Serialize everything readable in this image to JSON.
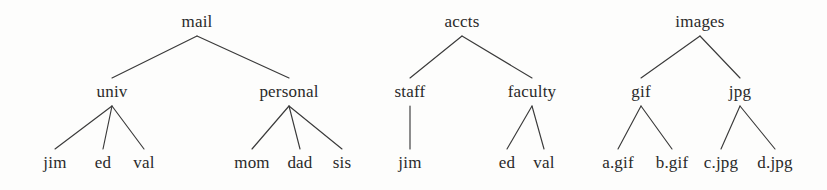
{
  "diagram": {
    "background_color": "#fdfdfc",
    "line_color": "#3a3a3a",
    "text_color": "#2a2a2a",
    "trees": [
      {
        "name": "mail-tree",
        "root": "mail",
        "nodes": [
          {
            "id": "mail",
            "label": "mail",
            "x": 197,
            "y": 22,
            "level": 0
          },
          {
            "id": "univ",
            "label": "univ",
            "x": 112,
            "y": 92,
            "level": 1
          },
          {
            "id": "personal",
            "label": "personal",
            "x": 289,
            "y": 92,
            "level": 1
          },
          {
            "id": "mail-jim",
            "label": "jim",
            "x": 55,
            "y": 163,
            "level": 2
          },
          {
            "id": "mail-ed",
            "label": "ed",
            "x": 103,
            "y": 163,
            "level": 2
          },
          {
            "id": "mail-val",
            "label": "val",
            "x": 144,
            "y": 163,
            "level": 2
          },
          {
            "id": "mail-mom",
            "label": "mom",
            "x": 252,
            "y": 163,
            "level": 2
          },
          {
            "id": "mail-dad",
            "label": "dad",
            "x": 300,
            "y": 163,
            "level": 2
          },
          {
            "id": "mail-sis",
            "label": "sis",
            "x": 342,
            "y": 163,
            "level": 2
          }
        ],
        "edges": [
          {
            "from": "mail",
            "to": "univ"
          },
          {
            "from": "mail",
            "to": "personal"
          },
          {
            "from": "univ",
            "to": "mail-jim"
          },
          {
            "from": "univ",
            "to": "mail-ed"
          },
          {
            "from": "univ",
            "to": "mail-val"
          },
          {
            "from": "personal",
            "to": "mail-mom"
          },
          {
            "from": "personal",
            "to": "mail-dad"
          },
          {
            "from": "personal",
            "to": "mail-sis"
          }
        ]
      },
      {
        "name": "accts-tree",
        "root": "accts",
        "nodes": [
          {
            "id": "accts",
            "label": "accts",
            "x": 462,
            "y": 22,
            "level": 0
          },
          {
            "id": "staff",
            "label": "staff",
            "x": 410,
            "y": 92,
            "level": 1
          },
          {
            "id": "faculty",
            "label": "faculty",
            "x": 532,
            "y": 92,
            "level": 1
          },
          {
            "id": "accts-jim",
            "label": "jim",
            "x": 410,
            "y": 163,
            "level": 2
          },
          {
            "id": "accts-ed",
            "label": "ed",
            "x": 507,
            "y": 163,
            "level": 2
          },
          {
            "id": "accts-val",
            "label": "val",
            "x": 544,
            "y": 163,
            "level": 2
          }
        ],
        "edges": [
          {
            "from": "accts",
            "to": "staff"
          },
          {
            "from": "accts",
            "to": "faculty"
          },
          {
            "from": "staff",
            "to": "accts-jim"
          },
          {
            "from": "faculty",
            "to": "accts-ed"
          },
          {
            "from": "faculty",
            "to": "accts-val"
          }
        ]
      },
      {
        "name": "images-tree",
        "root": "images",
        "nodes": [
          {
            "id": "images",
            "label": "images",
            "x": 700,
            "y": 22,
            "level": 0
          },
          {
            "id": "gif",
            "label": "gif",
            "x": 641,
            "y": 92,
            "level": 1
          },
          {
            "id": "jpg",
            "label": "jpg",
            "x": 740,
            "y": 92,
            "level": 1
          },
          {
            "id": "a-gif",
            "label": "a.gif",
            "x": 618,
            "y": 163,
            "level": 2
          },
          {
            "id": "b-gif",
            "label": "b.gif",
            "x": 672,
            "y": 163,
            "level": 2
          },
          {
            "id": "c-jpg",
            "label": "c.jpg",
            "x": 721,
            "y": 163,
            "level": 2
          },
          {
            "id": "d-jpg",
            "label": "d.jpg",
            "x": 775,
            "y": 163,
            "level": 2
          }
        ],
        "edges": [
          {
            "from": "images",
            "to": "gif"
          },
          {
            "from": "images",
            "to": "jpg"
          },
          {
            "from": "gif",
            "to": "a-gif"
          },
          {
            "from": "gif",
            "to": "b-gif"
          },
          {
            "from": "jpg",
            "to": "c-jpg"
          },
          {
            "from": "jpg",
            "to": "d-jpg"
          }
        ]
      }
    ]
  }
}
